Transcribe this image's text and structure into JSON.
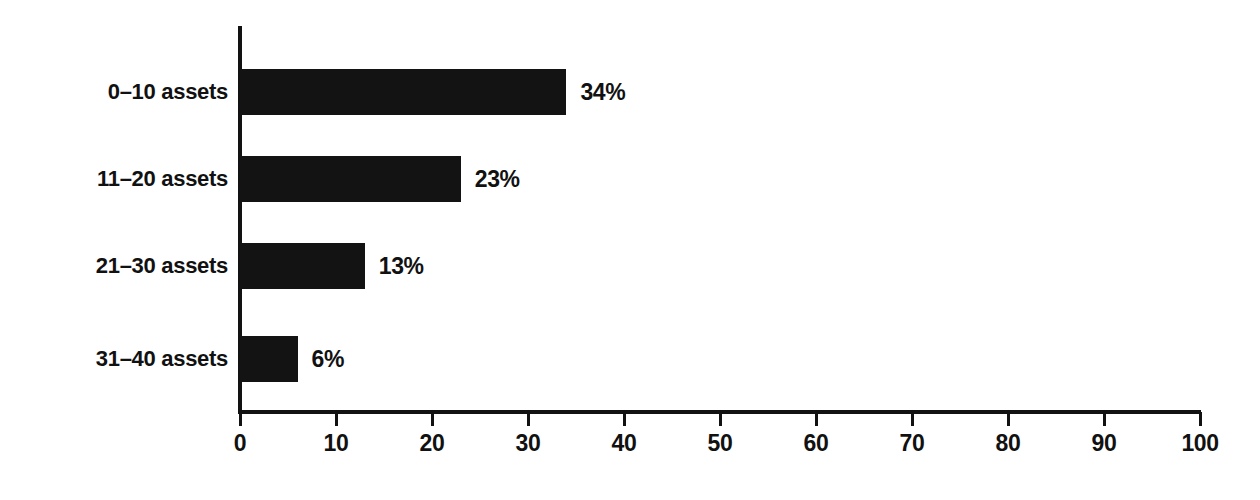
{
  "chart_data": {
    "type": "bar",
    "orientation": "horizontal",
    "title": "",
    "xlabel": "",
    "ylabel": "",
    "categories": [
      "0–10 assets",
      "11–20 assets",
      "21–30 assets",
      "31–40 assets"
    ],
    "values": [
      34,
      23,
      13,
      6
    ],
    "value_labels": [
      "34%",
      "23%",
      "13%",
      "6%"
    ],
    "xlim": [
      0,
      100
    ],
    "xticks": [
      0,
      10,
      20,
      30,
      40,
      50,
      60,
      70,
      80,
      90,
      100
    ],
    "xtick_labels": [
      "0",
      "10",
      "20",
      "30",
      "40",
      "50",
      "60",
      "70",
      "80",
      "90",
      "100"
    ],
    "grid": false,
    "legend": null,
    "bar_color": "#131313",
    "axis_color": "#121212",
    "background_color": "#ffffff"
  }
}
